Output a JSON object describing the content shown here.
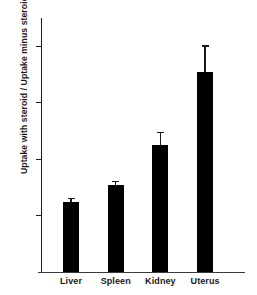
{
  "chart_data": {
    "type": "bar",
    "title": "",
    "subtitle": "",
    "xlabel": "",
    "ylabel": "Uptake with steroid / Uptake minus steroid",
    "categories": [
      "Liver",
      "Spleen",
      "Kidney",
      "Uterus"
    ],
    "values": [
      1.24,
      1.55,
      2.25,
      3.55
    ],
    "errors": [
      0.07,
      0.07,
      0.23,
      0.47
    ],
    "ylim": [
      0.0,
      4.55
    ],
    "yticks": [
      1.0,
      2.0,
      3.0,
      4.0
    ],
    "ytick_labels": [
      "1.0",
      "2.0",
      "3.0",
      "4.0"
    ],
    "grid": false,
    "legend": null,
    "bar_color": "#000000",
    "axis_color": "#1a1a1a",
    "error_bar_style": "cap"
  },
  "axis": {
    "y_title": "Uptake with steroid / Uptake minus steroid"
  }
}
